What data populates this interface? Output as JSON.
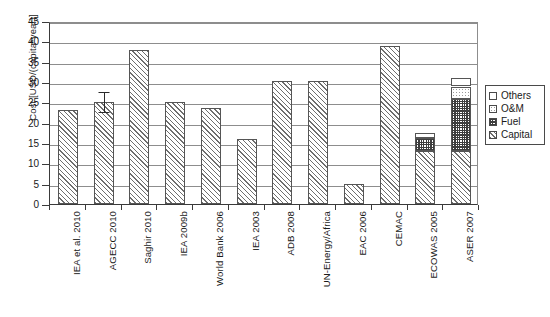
{
  "chart_data": {
    "type": "bar",
    "title": "",
    "subtitle": "",
    "xlabel": "",
    "ylabel": "Cost [USD/(capita*year)]",
    "ylim": [
      0,
      45
    ],
    "ytick_step": 5,
    "yticks": [
      0,
      5,
      10,
      15,
      20,
      25,
      30,
      35,
      40,
      45
    ],
    "ytick_labels": [
      "0",
      "5",
      "10",
      "15",
      "20",
      "25",
      "30",
      "35",
      "40",
      "45"
    ],
    "grid": "horizontal",
    "legend_position": "right",
    "stacked": true,
    "categories": [
      "IEA et al. 2010",
      "AGECC 2010",
      "Saghir 2010",
      "IEA 2009b",
      "World Bank 2006",
      "IEA 2003",
      "ADB 2008",
      "UN-Energy/Africa",
      "EAC 2006",
      "CEMAC",
      "ECOWAS 2005",
      "ASER 2007"
    ],
    "series": [
      {
        "name": "Capital",
        "pattern": "diagonal-hatch",
        "values": [
          23.0,
          25.0,
          37.8,
          25.1,
          23.7,
          16.0,
          30.3,
          30.3,
          5.0,
          38.9,
          13.0,
          13.0
        ]
      },
      {
        "name": "Fuel",
        "pattern": "cross-hatch",
        "values": [
          0,
          0,
          0,
          0,
          0,
          0,
          0,
          0,
          0,
          0,
          3.2,
          12.8
        ]
      },
      {
        "name": "O&M",
        "pattern": "dotted",
        "values": [
          0,
          0,
          0,
          0,
          0,
          0,
          0,
          0,
          0,
          0,
          0,
          3.1
        ]
      },
      {
        "name": "Others",
        "pattern": "plain-white",
        "values": [
          0,
          0,
          0,
          0,
          0,
          0,
          0,
          0,
          0,
          0,
          1.3,
          2.1
        ]
      }
    ],
    "totals": [
      23.0,
      25.0,
      37.8,
      25.1,
      23.7,
      16.0,
      30.3,
      30.3,
      5.0,
      38.9,
      17.5,
      31.0
    ],
    "error_bars": [
      {
        "category": "AGECC 2010",
        "value": 25.0,
        "low": 22.4,
        "high": 27.6
      }
    ],
    "legend": [
      {
        "label": "Others",
        "pattern": "plain-white"
      },
      {
        "label": "O&M",
        "pattern": "dotted"
      },
      {
        "label": "Fuel",
        "pattern": "cross-hatch"
      },
      {
        "label": "Capital",
        "pattern": "diagonal-hatch"
      }
    ],
    "colors": {
      "axis": "#3a3a3a",
      "gridline": "#8d8d8d",
      "bar_outline": "#555555",
      "background": "#ffffff",
      "text": "#1a1a1a"
    }
  }
}
